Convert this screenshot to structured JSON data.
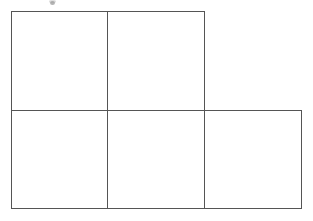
{
  "figure": {
    "shape_name": "P-pentomino grid",
    "cell_count": 5,
    "rows": [
      {
        "row_index": 0,
        "cells": 2,
        "label": "top-row"
      },
      {
        "row_index": 1,
        "cells": 3,
        "label": "bottom-row"
      }
    ],
    "geometry": {
      "origin_x": 11,
      "origin_y": 11,
      "cell_width": 96.5,
      "cell_height": 98.5,
      "top_row_left": 11,
      "top_row_right": 204,
      "top_row_top": 11,
      "middle_y": 110,
      "bottom_row_left": 11,
      "bottom_row_right": 301,
      "bottom_y": 208,
      "divider_x_1": 107,
      "divider_x_2": 204
    },
    "stroke": {
      "color": "#555555",
      "light_color": "#7d7d7d",
      "width": 1
    },
    "background_color": "#ffffff",
    "cells": [
      {
        "id": "cell-r0-c0",
        "row": 0,
        "col": 0,
        "x": 11,
        "y": 11,
        "w": 96,
        "h": 99,
        "content": ""
      },
      {
        "id": "cell-r0-c1",
        "row": 0,
        "col": 1,
        "x": 107,
        "y": 11,
        "w": 97,
        "h": 99,
        "content": ""
      },
      {
        "id": "cell-r1-c0",
        "row": 1,
        "col": 0,
        "x": 11,
        "y": 110,
        "w": 96,
        "h": 98,
        "content": ""
      },
      {
        "id": "cell-r1-c1",
        "row": 1,
        "col": 1,
        "x": 107,
        "y": 110,
        "w": 97,
        "h": 98,
        "content": ""
      },
      {
        "id": "cell-r1-c2",
        "row": 1,
        "col": 2,
        "x": 204,
        "y": 110,
        "w": 97,
        "h": 98,
        "content": ""
      }
    ],
    "artifact": {
      "name": "scan-speck",
      "x": 50,
      "y": 1,
      "width": 5,
      "height": 4,
      "color": "#9a9a9a",
      "note": "small gray speck at top edge, partially cropped"
    }
  }
}
